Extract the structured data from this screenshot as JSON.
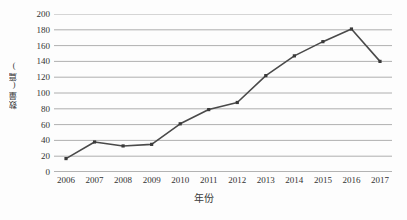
{
  "chart_data": {
    "type": "line",
    "title": "",
    "xlabel": "年份",
    "ylabel": "数量(篇)",
    "categories": [
      "2006",
      "2007",
      "2008",
      "2009",
      "2010",
      "2011",
      "2012",
      "2013",
      "2014",
      "2015",
      "2016",
      "2017"
    ],
    "values": [
      17,
      38,
      33,
      35,
      61,
      79,
      88,
      122,
      147,
      165,
      181,
      140
    ],
    "series": [
      {
        "name": "数量(篇)",
        "values": [
          17,
          38,
          33,
          35,
          61,
          79,
          88,
          122,
          147,
          165,
          181,
          140
        ]
      }
    ],
    "ylim": [
      0,
      200
    ],
    "ytick_labels": [
      "0",
      "20",
      "40",
      "60",
      "80",
      "100",
      "120",
      "140",
      "160",
      "180",
      "200"
    ],
    "ytick_values": [
      0,
      20,
      40,
      60,
      80,
      100,
      120,
      140,
      160,
      180,
      200
    ],
    "grid": "horizontal",
    "legend": "none",
    "marker": "square",
    "colors": {
      "line": "#4a4a4a",
      "marker": "#3a3a3a",
      "grid": "#9a9a9a",
      "axis": "#6b6b6b",
      "background": "#fdfdfd",
      "text": "#333333"
    }
  }
}
